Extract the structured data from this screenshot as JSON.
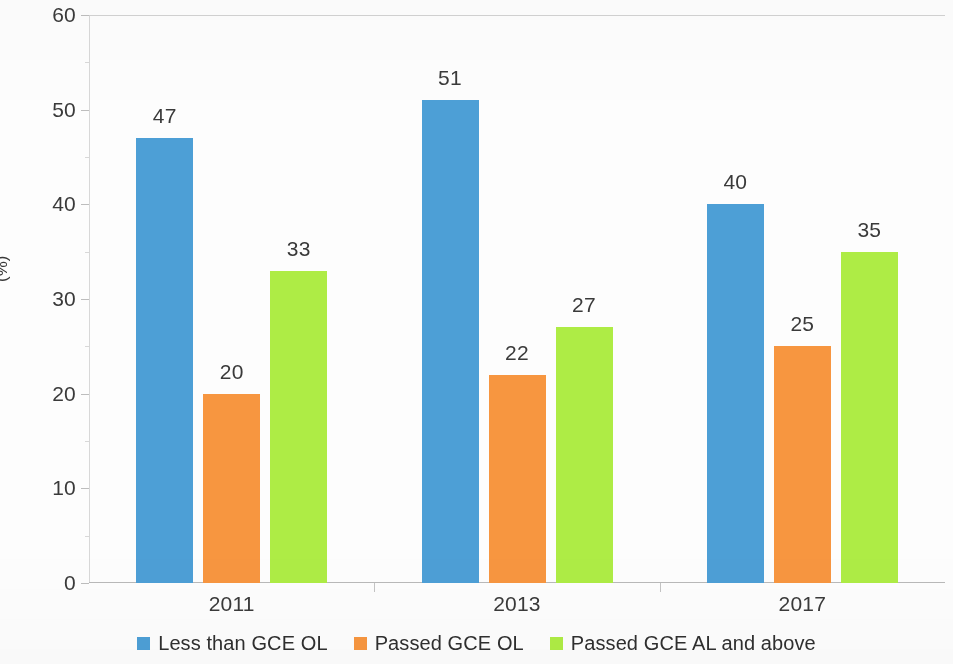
{
  "chart_data": {
    "type": "bar",
    "title": "",
    "subtitle": "",
    "xlabel": "",
    "ylabel": "(%)",
    "ylim": [
      0,
      60
    ],
    "ytick_step": 10,
    "yticks": [
      "0",
      "10",
      "20",
      "30",
      "40",
      "50",
      "60"
    ],
    "grid": "horizontal-major",
    "legend_position": "bottom-center",
    "categories": [
      "2011",
      "2013",
      "2017"
    ],
    "series": [
      {
        "name": "Less than GCE OL",
        "color": "#4d9fd6",
        "values": [
          47,
          51,
          40
        ],
        "labels": [
          "47",
          "51",
          "40"
        ]
      },
      {
        "name": "Passed GCE OL",
        "color": "#f79640",
        "values": [
          20,
          22,
          25
        ],
        "labels": [
          "20",
          "22",
          "25"
        ]
      },
      {
        "name": "Passed GCE AL and above",
        "color": "#aeec45",
        "values": [
          33,
          27,
          35
        ],
        "labels": [
          "33",
          "27",
          "35"
        ]
      }
    ]
  },
  "axis": {
    "y_title": "(%)"
  },
  "legend": {
    "items": [
      {
        "label": "Less than GCE OL",
        "color": "#4d9fd6"
      },
      {
        "label": "Passed GCE OL",
        "color": "#f79640"
      },
      {
        "label": "Passed GCE AL and above",
        "color": "#aeec45"
      }
    ]
  }
}
